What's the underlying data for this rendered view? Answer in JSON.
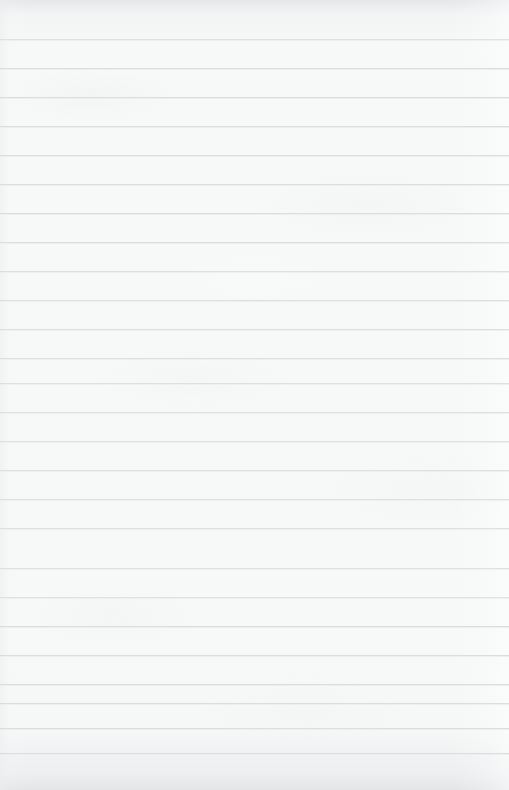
{
  "document": {
    "type": "ruled-paper",
    "title": "Blank ruled notebook page",
    "content_text": "",
    "has_text": false,
    "has_margin_line": false,
    "has_holes": false,
    "page_width": 509,
    "page_height": 790
  },
  "paper": {
    "background_color": "#f7f8f8",
    "edge_tint_color": "#e2e4e6",
    "texture": "subtle-fibre-mottle"
  },
  "rules": {
    "color": "#d9dbdd",
    "thickness": 1,
    "spacing": 29,
    "first_line_y": 39,
    "count": 26,
    "positions": [
      39,
      68,
      97,
      126,
      155,
      184,
      213,
      242,
      271,
      300,
      329,
      358,
      383,
      412,
      441,
      470,
      499,
      528,
      568,
      597,
      626,
      655,
      684,
      703,
      728,
      753
    ]
  }
}
